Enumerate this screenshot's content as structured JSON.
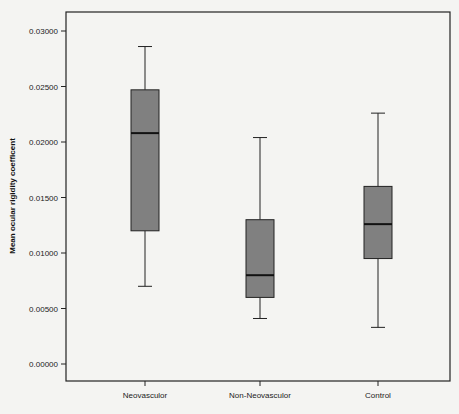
{
  "chart_data": {
    "type": "box",
    "title": "",
    "xlabel": "",
    "ylabel": "Mean ocular rigidity coefficent",
    "ylim": [
      -0.0015,
      0.0315
    ],
    "yticks": [
      "0.00000",
      "0.00500",
      "0.01000",
      "0.01500",
      "0.02000",
      "0.02500",
      "0.03000"
    ],
    "ytick_values": [
      0.0,
      0.005,
      0.01,
      0.015,
      0.02,
      0.025,
      0.03
    ],
    "categories": [
      "Neovasculor",
      "Non-Neovasculor",
      "Control"
    ],
    "boxes": [
      {
        "name": "Neovasculor",
        "whisker_low": 0.007,
        "q1": 0.012,
        "median": 0.0208,
        "q3": 0.0247,
        "whisker_high": 0.0286
      },
      {
        "name": "Non-Neovasculor",
        "whisker_low": 0.0041,
        "q1": 0.006,
        "median": 0.008,
        "q3": 0.013,
        "whisker_high": 0.0204
      },
      {
        "name": "Control",
        "whisker_low": 0.0033,
        "q1": 0.0095,
        "median": 0.0126,
        "q3": 0.016,
        "whisker_high": 0.0226
      }
    ],
    "grid": false,
    "legend": null,
    "box_color": "#808080"
  }
}
